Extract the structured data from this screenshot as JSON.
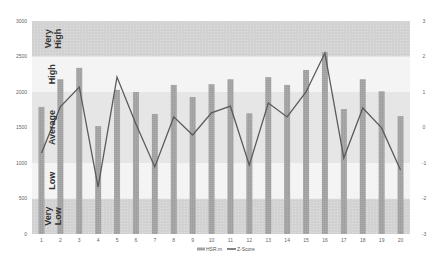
{
  "chart_data": {
    "type": "bar",
    "title": "",
    "xlabel": "",
    "ylabel": "",
    "y2label": "",
    "categories": [
      "1",
      "2",
      "3",
      "4",
      "5",
      "6",
      "7",
      "8",
      "9",
      "10",
      "11",
      "12",
      "13",
      "14",
      "15",
      "16",
      "17",
      "18",
      "19",
      "20"
    ],
    "series": [
      {
        "name": "HSR.m",
        "type": "bar",
        "axis": "left",
        "values": [
          1790,
          2180,
          2340,
          1520,
          2030,
          2000,
          1690,
          2100,
          1930,
          2110,
          2180,
          1700,
          2210,
          2100,
          2310,
          2560,
          1760,
          2180,
          2010,
          1660
        ]
      },
      {
        "name": "Z-Score",
        "type": "line",
        "axis": "right",
        "values": [
          -0.72,
          0.58,
          1.14,
          -1.68,
          1.42,
          0.1,
          -1.11,
          0.3,
          -0.21,
          0.41,
          0.6,
          -1.06,
          0.69,
          0.3,
          1.0,
          2.1,
          -0.86,
          0.55,
          -0.01,
          -1.2
        ]
      }
    ],
    "ylim": [
      0,
      3000
    ],
    "y_ticks": [
      "0",
      "500",
      "1000",
      "1500",
      "2000",
      "2500",
      "3000"
    ],
    "y2lim": [
      -3,
      3
    ],
    "y2_ticks": [
      "-3",
      "-2",
      "-1",
      "0",
      "1",
      "2",
      "3"
    ],
    "bands": [
      {
        "label": "Very Low",
        "from": 0,
        "to": 500,
        "color": "#d6d6d6"
      },
      {
        "label": "Low",
        "from": 500,
        "to": 1000,
        "color": "#f4f4f4"
      },
      {
        "label": "Average",
        "from": 1000,
        "to": 2000,
        "color": "#e6e6e6"
      },
      {
        "label": "High",
        "from": 2000,
        "to": 2500,
        "color": "#f4f4f4"
      },
      {
        "label": "Very High",
        "from": 2500,
        "to": 3000,
        "color": "#d2d2d2"
      }
    ],
    "grid": false,
    "legend_position": "bottom",
    "colors": {
      "bar": "#a3a3a3",
      "line": "#5a5a5a"
    }
  },
  "legend": [
    {
      "label": "HSR.m",
      "swatch": "bar"
    },
    {
      "label": "Z-Score",
      "swatch": "line"
    }
  ]
}
